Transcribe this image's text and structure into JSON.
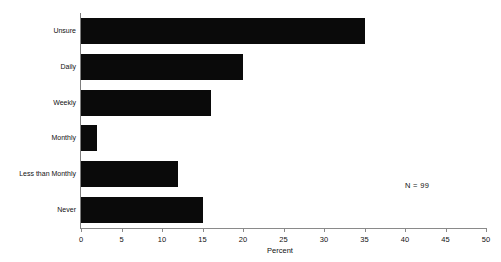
{
  "chart_data": {
    "type": "bar",
    "orientation": "horizontal",
    "title": "",
    "xlabel": "Percent",
    "ylabel": "",
    "categories": [
      "Unsure",
      "Daily",
      "Weekly",
      "Monthly",
      "Less than Monthly",
      "Never"
    ],
    "values": [
      35,
      20,
      16,
      2,
      12,
      15
    ],
    "xlim": [
      0,
      50
    ],
    "xticks": [
      0,
      5,
      10,
      15,
      20,
      25,
      30,
      35,
      40,
      45,
      50
    ],
    "xtick_labels": [
      "0",
      "5",
      "10",
      "15",
      "20",
      "25",
      "30",
      "35",
      "40",
      "45",
      "50"
    ],
    "grid": false,
    "legend": null,
    "annotations": [
      {
        "text": "N = 99",
        "position": "right-middle"
      }
    ],
    "bar_color": "#0a0a0a",
    "background_color": "#ffffff",
    "axis_color": "#8a8a8a"
  }
}
